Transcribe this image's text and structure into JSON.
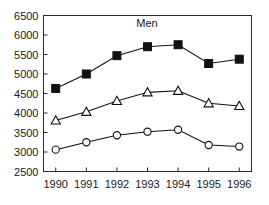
{
  "chart_data": {
    "type": "line",
    "title": "Men",
    "xlabel": "",
    "ylabel": "",
    "categories": [
      "1990",
      "1991",
      "1992",
      "1993",
      "1994",
      "1995",
      "1996"
    ],
    "x": [
      1990,
      1991,
      1992,
      1993,
      1994,
      1995,
      1996
    ],
    "xlim": [
      1989.6,
      1996.4
    ],
    "ylim": [
      2500,
      6500
    ],
    "ytick_labels": [
      "2500",
      "3000",
      "3500",
      "4000",
      "4500",
      "5000",
      "5500",
      "6000",
      "6500"
    ],
    "yticks": [
      2500,
      3000,
      3500,
      4000,
      4500,
      5000,
      5500,
      6000,
      6500
    ],
    "xtick_labels": [
      "1990",
      "1991",
      "1992",
      "1993",
      "1994",
      "1995",
      "1996"
    ],
    "grid": false,
    "legend": "none",
    "series": [
      {
        "name": "filled-square-series",
        "marker": "filled-square",
        "color": "#111111",
        "values": [
          4630,
          5000,
          5470,
          5700,
          5750,
          5270,
          5380
        ]
      },
      {
        "name": "open-triangle-series",
        "marker": "open-triangle",
        "color": "#111111",
        "values": [
          3810,
          4030,
          4310,
          4530,
          4570,
          4250,
          4180
        ]
      },
      {
        "name": "open-circle-series",
        "marker": "open-circle",
        "color": "#111111",
        "values": [
          3060,
          3250,
          3430,
          3520,
          3570,
          3180,
          3140
        ]
      }
    ]
  },
  "figure": {
    "background": "#ffffff",
    "axis_color": "#2b2b2b",
    "title_text": "Men"
  }
}
